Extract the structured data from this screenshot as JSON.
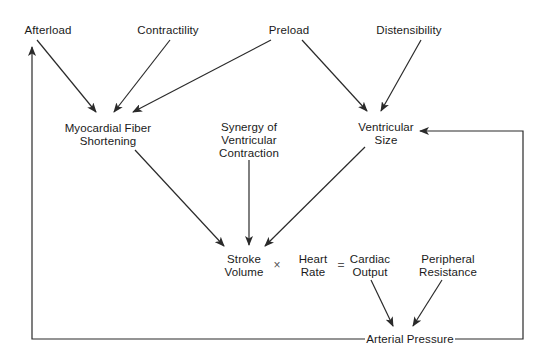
{
  "diagram": {
    "nodes": {
      "afterload": {
        "label": "Afterload",
        "x": 48,
        "y": 24
      },
      "contractility": {
        "label": "Contractility",
        "x": 168,
        "y": 24
      },
      "preload": {
        "label": "Preload",
        "x": 289,
        "y": 24
      },
      "distensibility": {
        "label": "Distensibility",
        "x": 409,
        "y": 24
      },
      "myocardial_fiber_shortening": {
        "line1": "Myocardial Fiber",
        "line2": "Shortening",
        "x": 107,
        "y": 123
      },
      "synergy": {
        "line1": "Synergy of",
        "line2": "Ventricular",
        "line3": "Contraction",
        "x": 249,
        "y": 121
      },
      "ventricular_size": {
        "line1": "Ventricular",
        "line2": "Size",
        "x": 386,
        "y": 121
      },
      "stroke_volume": {
        "line1": "Stroke",
        "line2": "Volume",
        "x": 244,
        "y": 253
      },
      "heart_rate": {
        "line1": "Heart",
        "line2": "Rate",
        "x": 313,
        "y": 253
      },
      "cardiac_output": {
        "line1": "Cardiac",
        "line2": "Output",
        "x": 370,
        "y": 253
      },
      "peripheral_resistance": {
        "line1": "Peripheral",
        "line2": "Resistance",
        "x": 448,
        "y": 253
      },
      "arterial_pressure": {
        "label": "Arterial Pressure",
        "x": 420,
        "y": 333
      }
    },
    "operators": {
      "times": "×",
      "equals": "="
    },
    "edges": [
      {
        "from": "Afterload",
        "to": "Myocardial Fiber Shortening"
      },
      {
        "from": "Contractility",
        "to": "Myocardial Fiber Shortening"
      },
      {
        "from": "Preload",
        "to": "Myocardial Fiber Shortening"
      },
      {
        "from": "Preload",
        "to": "Ventricular Size"
      },
      {
        "from": "Distensibility",
        "to": "Ventricular Size"
      },
      {
        "from": "Myocardial Fiber Shortening",
        "to": "Stroke Volume"
      },
      {
        "from": "Synergy of Ventricular Contraction",
        "to": "Stroke Volume"
      },
      {
        "from": "Ventricular Size",
        "to": "Stroke Volume"
      },
      {
        "from": "Cardiac Output",
        "to": "Arterial Pressure"
      },
      {
        "from": "Peripheral Resistance",
        "to": "Arterial Pressure"
      },
      {
        "from": "Arterial Pressure",
        "to": "Afterload"
      },
      {
        "from": "Arterial Pressure",
        "to": "Ventricular Size"
      }
    ],
    "line_color": "#2a2a2a",
    "text_color": "#1a1a1a"
  }
}
